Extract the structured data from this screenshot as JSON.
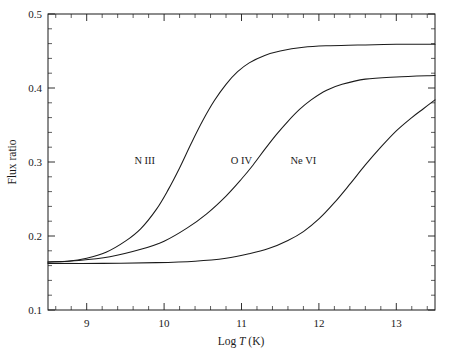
{
  "chart_data": {
    "type": "line",
    "title": "",
    "xlabel": "Log T (K)",
    "xlabel_prefix": "Log ",
    "xlabel_symbol": "T",
    "xlabel_suffix": " (K)",
    "ylabel": "Flux ratio",
    "xlim": [
      8.5,
      13.5
    ],
    "ylim": [
      0.1,
      0.5
    ],
    "xticks": [
      9,
      10,
      11,
      12,
      13
    ],
    "xtick_labels": [
      "9",
      "10",
      "11",
      "12",
      "13"
    ],
    "yticks": [
      0.1,
      0.2,
      0.3,
      0.4,
      0.5
    ],
    "ytick_labels": [
      "0.1",
      "0.2",
      "0.3",
      "0.4",
      "0.5"
    ],
    "minor_ticks_per_major_x": 5,
    "minor_ticks_per_major_y": 5,
    "grid": false,
    "legend_position": "inline-annotations",
    "baseline_value": 0.165,
    "series": [
      {
        "name": "N III",
        "label": "N III",
        "label_x": 9.75,
        "label_y": 0.297,
        "color": "#1a1a1a",
        "plateau": 0.459,
        "midpoint": 10.45,
        "x": [
          8.5,
          8.75,
          9.0,
          9.25,
          9.5,
          9.7,
          9.9,
          10.05,
          10.2,
          10.35,
          10.5,
          10.65,
          10.8,
          10.95,
          11.1,
          11.3,
          11.5,
          11.8,
          12.1,
          12.5,
          13.0,
          13.5
        ],
        "y": [
          0.165,
          0.166,
          0.17,
          0.178,
          0.193,
          0.21,
          0.236,
          0.262,
          0.292,
          0.325,
          0.356,
          0.383,
          0.405,
          0.422,
          0.434,
          0.444,
          0.45,
          0.455,
          0.457,
          0.458,
          0.459,
          0.459
        ]
      },
      {
        "name": "O IV",
        "label": "O IV",
        "label_x": 11.0,
        "label_y": 0.297,
        "color": "#1a1a1a",
        "plateau": 0.417,
        "midpoint": 11.3,
        "x": [
          8.5,
          8.9,
          9.3,
          9.7,
          10.0,
          10.3,
          10.55,
          10.8,
          11.0,
          11.15,
          11.3,
          11.45,
          11.6,
          11.75,
          11.9,
          12.1,
          12.3,
          12.6,
          13.0,
          13.5
        ],
        "y": [
          0.165,
          0.167,
          0.172,
          0.182,
          0.193,
          0.211,
          0.23,
          0.254,
          0.277,
          0.296,
          0.317,
          0.337,
          0.355,
          0.371,
          0.384,
          0.397,
          0.405,
          0.412,
          0.415,
          0.417
        ]
      },
      {
        "name": "Ne VI",
        "label": "Ne VI",
        "label_x": 11.8,
        "label_y": 0.297,
        "color": "#1a1a1a",
        "plateau": 0.384,
        "midpoint": 12.25,
        "x": [
          8.5,
          9.2,
          9.9,
          10.4,
          10.8,
          11.1,
          11.35,
          11.6,
          11.8,
          12.0,
          12.2,
          12.4,
          12.6,
          12.8,
          13.0,
          13.2,
          13.35,
          13.5
        ],
        "y": [
          0.163,
          0.163,
          0.164,
          0.166,
          0.17,
          0.176,
          0.183,
          0.194,
          0.206,
          0.223,
          0.245,
          0.27,
          0.296,
          0.32,
          0.342,
          0.36,
          0.372,
          0.384
        ]
      }
    ]
  }
}
